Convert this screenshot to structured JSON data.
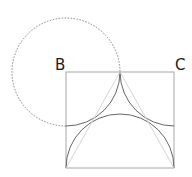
{
  "diagram": {
    "labels": {
      "b": "B",
      "c": "C"
    },
    "colors": {
      "square": "#a8a8a8",
      "arc": "#555555",
      "dashed": "#777777",
      "light": "#d0d0d0"
    }
  }
}
